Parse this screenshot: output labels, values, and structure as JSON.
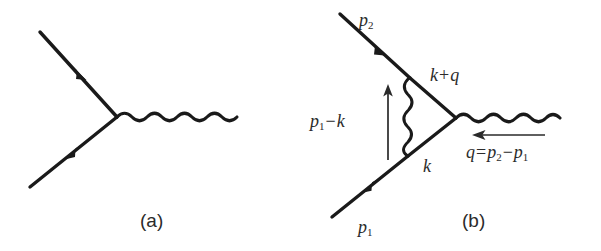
{
  "figure": {
    "background_color": "#ffffff",
    "ink_color": "#1a1a1a",
    "label_color": "#2b2b2b"
  },
  "panels": [
    {
      "id": "a",
      "caption": "(a)",
      "description": "Tree-level QED vertex: two fermion legs meeting a photon line",
      "labels": []
    },
    {
      "id": "b",
      "caption": "(b)",
      "description": "One-loop vertex correction with internal photon exchange",
      "labels": [
        {
          "name": "outgoing-momentum",
          "text": "p2",
          "base": "p",
          "sub": "2"
        },
        {
          "name": "incoming-momentum",
          "text": "p1",
          "base": "p",
          "sub": "1"
        },
        {
          "name": "loop-upper-momentum",
          "text": "k + q"
        },
        {
          "name": "loop-lower-momentum",
          "text": "k"
        },
        {
          "name": "photon-loop-momentum",
          "text": "p1 - k"
        },
        {
          "name": "transfer-momentum",
          "text": "q = p2 - p1"
        }
      ]
    }
  ],
  "labels": {
    "panel_a_caption": "(a)",
    "panel_b_caption": "(b)",
    "p2": "p",
    "p2_sub": "2",
    "p1": "p",
    "p1_sub": "1",
    "k_plus_q_k": "k",
    "k_plus_q_op": "+",
    "k_plus_q_q": "q",
    "k_lower": "k",
    "p1_minus_k_p": "p",
    "p1_minus_k_sub": "1",
    "p1_minus_k_op": "−",
    "p1_minus_k_k": "k",
    "q_eq_q": "q",
    "q_eq_equals": "=",
    "q_eq_p2": "p",
    "q_eq_p2_sub": "2",
    "q_eq_minus": "−",
    "q_eq_p1": "p",
    "q_eq_p1_sub": "1"
  }
}
